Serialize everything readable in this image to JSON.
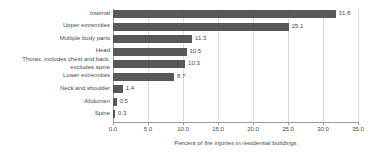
{
  "chart_data": {
    "type": "bar",
    "orientation": "horizontal",
    "title": "",
    "xlabel": "Percent of fire injuries in residential buildings",
    "ylabel": "",
    "xlim": [
      0.0,
      35.0
    ],
    "xticks": [
      "0.0",
      "5.0",
      "10.0",
      "15.0",
      "20.0",
      "25.0",
      "30.0",
      "35.0"
    ],
    "xtick_values": [
      0.0,
      5.0,
      10.0,
      15.0,
      20.0,
      25.0,
      30.0,
      35.0
    ],
    "grid": true,
    "legend": "none",
    "bar_color": "#58585a",
    "categories": [
      "Internal",
      "Upper extremities",
      "Multiple body parts",
      "Head",
      "Thorax, includes chest and back,\nexcludes spine",
      "Lower extremities",
      "Neck and shoulder",
      "Abdomen",
      "Spine"
    ],
    "values": [
      31.8,
      25.1,
      11.3,
      10.5,
      10.3,
      8.7,
      1.4,
      0.5,
      0.3
    ],
    "value_labels": [
      "31.8",
      "25.1",
      "11.3",
      "10.5",
      "10.3",
      "8.7",
      "1.4",
      "0.5",
      "0.3"
    ]
  }
}
